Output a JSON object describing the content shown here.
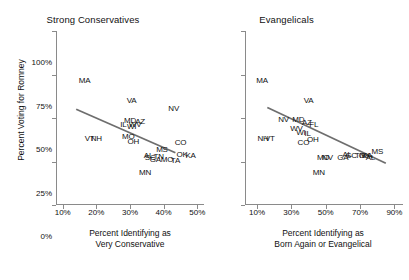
{
  "chart_data": [
    {
      "type": "scatter",
      "title": "Strong Conservatives",
      "xlabel": "Percent Identifying as Very Conservative",
      "ylabel": "Percent Voting for Romney",
      "xlim": [
        8,
        52
      ],
      "ylim": [
        0,
        100
      ],
      "xticks": [
        "10%",
        "20%",
        "30%",
        "40%",
        "50%"
      ],
      "xtickvals": [
        10,
        20,
        30,
        40,
        50
      ],
      "yticks": [
        "0%",
        "25%",
        "50%",
        "75%",
        "100%"
      ],
      "ytickvals": [
        0,
        25,
        50,
        75,
        100
      ],
      "grid": false,
      "legend": "none",
      "point_style": "state-abbreviation-text",
      "fit_line": {
        "x0": 14.0,
        "y0": 55.0,
        "x1": 43.5,
        "y1": 30.0,
        "color": "#6e6e6e"
      },
      "points": [
        {
          "label": "MA",
          "x": 16.5,
          "y": 72.0
        },
        {
          "label": "VA",
          "x": 30.5,
          "y": 60.5
        },
        {
          "label": "NV",
          "x": 43.0,
          "y": 55.5
        },
        {
          "label": "MD",
          "x": 30.0,
          "y": 49.0
        },
        {
          "label": "AZ",
          "x": 33.0,
          "y": 48.0
        },
        {
          "label": "IL",
          "x": 28.0,
          "y": 46.5
        },
        {
          "label": "WI",
          "x": 30.5,
          "y": 45.5
        },
        {
          "label": "WV",
          "x": 31.5,
          "y": 46.5
        },
        {
          "label": "VT",
          "x": 18.0,
          "y": 38.5
        },
        {
          "label": "NH",
          "x": 20.0,
          "y": 38.5
        },
        {
          "label": "MO",
          "x": 29.5,
          "y": 39.5
        },
        {
          "label": "OH",
          "x": 31.0,
          "y": 37.0
        },
        {
          "label": "CO",
          "x": 45.0,
          "y": 36.0
        },
        {
          "label": "MS",
          "x": 39.5,
          "y": 32.0
        },
        {
          "label": "OK",
          "x": 45.5,
          "y": 29.5
        },
        {
          "label": "KA",
          "x": 48.0,
          "y": 28.5
        },
        {
          "label": "AL",
          "x": 35.5,
          "y": 28.5
        },
        {
          "label": "SC",
          "x": 36.0,
          "y": 27.5
        },
        {
          "label": "TN",
          "x": 38.5,
          "y": 28.0
        },
        {
          "label": "GA",
          "x": 37.5,
          "y": 26.5
        },
        {
          "label": "MO",
          "x": 41.0,
          "y": 26.5
        },
        {
          "label": "TA",
          "x": 43.5,
          "y": 26.0
        },
        {
          "label": "MN",
          "x": 34.5,
          "y": 19.0
        }
      ]
    },
    {
      "type": "scatter",
      "title": "Evangelicals",
      "xlabel": "Percent Identifying as Born Again or Evangelical",
      "ylabel": "Percent Voting for Romney",
      "xlim": [
        3,
        95
      ],
      "ylim": [
        0,
        100
      ],
      "xticks": [
        "10%",
        "30%",
        "50%",
        "70%",
        "90%"
      ],
      "xtickvals": [
        10,
        30,
        50,
        70,
        90
      ],
      "yticks": [
        "0%",
        "25%",
        "50%",
        "75%",
        "100%"
      ],
      "ytickvals": [
        0,
        25,
        50,
        75,
        100
      ],
      "grid": false,
      "legend": "none",
      "point_style": "state-abbreviation-text",
      "fit_line": {
        "x0": 16.0,
        "y0": 56.0,
        "x1": 85.0,
        "y1": 24.0,
        "color": "#6e6e6e"
      },
      "points": [
        {
          "label": "MA",
          "x": 13.0,
          "y": 72.0
        },
        {
          "label": "VA",
          "x": 40.0,
          "y": 60.5
        },
        {
          "label": "NV",
          "x": 25.5,
          "y": 49.5
        },
        {
          "label": "MD",
          "x": 34.0,
          "y": 49.5
        },
        {
          "label": "AZ",
          "x": 39.0,
          "y": 47.5
        },
        {
          "label": "FL",
          "x": 43.0,
          "y": 46.5
        },
        {
          "label": "WV",
          "x": 33.0,
          "y": 44.5
        },
        {
          "label": "WI",
          "x": 35.5,
          "y": 42.0
        },
        {
          "label": "IL",
          "x": 39.5,
          "y": 41.5
        },
        {
          "label": "NH",
          "x": 13.5,
          "y": 38.5
        },
        {
          "label": "VT",
          "x": 17.5,
          "y": 38.5
        },
        {
          "label": "CO",
          "x": 37.0,
          "y": 36.0
        },
        {
          "label": "OH",
          "x": 42.5,
          "y": 38.0
        },
        {
          "label": "MO",
          "x": 48.5,
          "y": 27.5
        },
        {
          "label": "NV",
          "x": 51.0,
          "y": 27.5
        },
        {
          "label": "AL",
          "x": 62.5,
          "y": 29.5
        },
        {
          "label": "SC",
          "x": 65.0,
          "y": 29.0
        },
        {
          "label": "GA",
          "x": 60.0,
          "y": 27.5
        },
        {
          "label": "TN",
          "x": 70.0,
          "y": 28.5
        },
        {
          "label": "OK",
          "x": 72.5,
          "y": 29.0
        },
        {
          "label": "KA",
          "x": 74.0,
          "y": 28.5
        },
        {
          "label": "AL",
          "x": 76.0,
          "y": 27.5
        },
        {
          "label": "MS",
          "x": 80.0,
          "y": 31.0
        },
        {
          "label": "MN",
          "x": 46.0,
          "y": 19.0
        }
      ]
    }
  ],
  "axis": {
    "ylabel": "Percent Voting for Romney",
    "left_xlabel_line1": "Percent Identifying as",
    "left_xlabel_line2": "Very Conservative",
    "right_xlabel_line1": "Percent Identifying as",
    "right_xlabel_line2": "Born Again or Evangelical"
  },
  "colors": {
    "axis": "#8a8a8a",
    "text": "#111111",
    "fit_line": "#6e6e6e",
    "background": "#ffffff"
  }
}
